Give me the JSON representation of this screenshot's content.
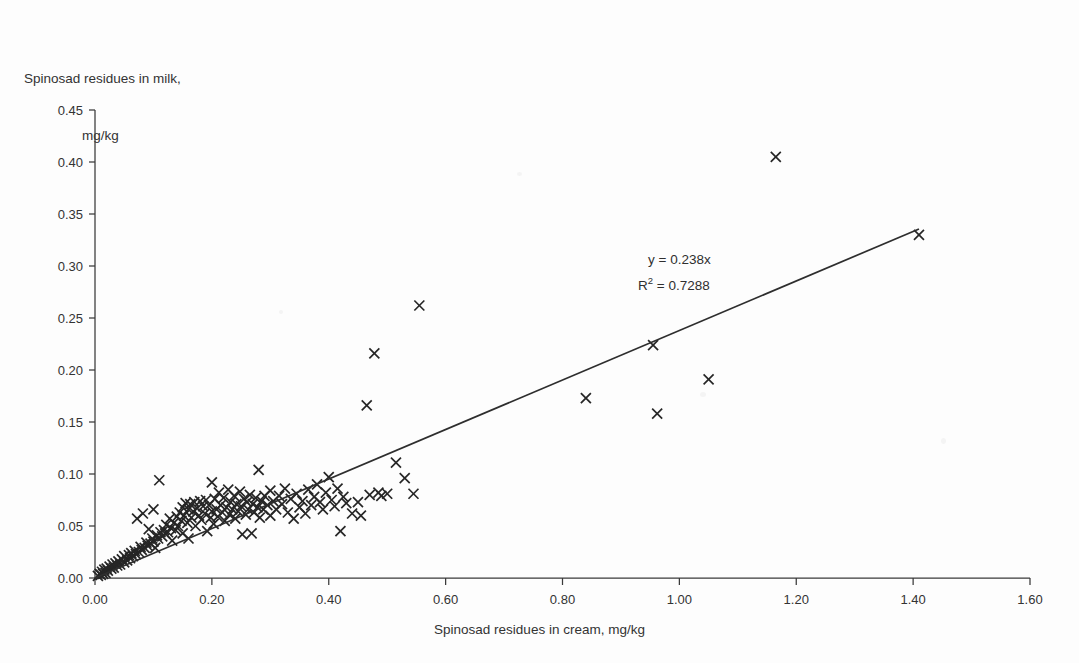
{
  "axes": {
    "y_title_line1": "Spinosad residues in milk,",
    "y_title_line2": "mg/kg",
    "x_title": "Spinosad residues in cream, mg/kg"
  },
  "annotation": {
    "equation": "y = 0.238x",
    "r_squared_prefix": "R",
    "r_squared_sup": "2",
    "r_squared_value": " = 0.7288"
  },
  "colors": {
    "background": "#fdfdfd",
    "axis": "#3a3a3a",
    "marker": "#262626",
    "trendline": "#2e2e2e",
    "text": "#333333"
  },
  "chart_data": {
    "type": "scatter",
    "title": "",
    "xlabel": "Spinosad residues in cream, mg/kg",
    "ylabel": "Spinosad residues in milk, mg/kg",
    "xlim": [
      0.0,
      1.6
    ],
    "ylim": [
      0.0,
      0.45
    ],
    "xticks": [
      "0.00",
      "0.20",
      "0.40",
      "0.60",
      "0.80",
      "1.00",
      "1.20",
      "1.40",
      "1.60"
    ],
    "xtick_values": [
      0.0,
      0.2,
      0.4,
      0.6,
      0.8,
      1.0,
      1.2,
      1.4,
      1.6
    ],
    "yticks": [
      "0.00",
      "0.05",
      "0.10",
      "0.15",
      "0.20",
      "0.25",
      "0.30",
      "0.35",
      "0.40",
      "0.45"
    ],
    "ytick_values": [
      0.0,
      0.05,
      0.1,
      0.15,
      0.2,
      0.25,
      0.3,
      0.35,
      0.4,
      0.45
    ],
    "grid": false,
    "legend": null,
    "marker_style": "x",
    "annotations": [
      "y = 0.238x",
      "R² = 0.7288"
    ],
    "fit": {
      "type": "linear-through-origin",
      "slope": 0.238,
      "intercept": 0.0,
      "r_squared": 0.7288,
      "x_start": 0.0,
      "x_end": 1.41
    },
    "series": [
      {
        "name": "Spinosad residue pairs",
        "points": [
          [
            0.005,
            0.002
          ],
          [
            0.008,
            0.004
          ],
          [
            0.01,
            0.003
          ],
          [
            0.012,
            0.006
          ],
          [
            0.014,
            0.004
          ],
          [
            0.016,
            0.008
          ],
          [
            0.018,
            0.005
          ],
          [
            0.02,
            0.009
          ],
          [
            0.022,
            0.007
          ],
          [
            0.025,
            0.011
          ],
          [
            0.028,
            0.009
          ],
          [
            0.03,
            0.013
          ],
          [
            0.032,
            0.01
          ],
          [
            0.035,
            0.014
          ],
          [
            0.038,
            0.012
          ],
          [
            0.04,
            0.016
          ],
          [
            0.043,
            0.013
          ],
          [
            0.046,
            0.018
          ],
          [
            0.05,
            0.015
          ],
          [
            0.05,
            0.021
          ],
          [
            0.055,
            0.017
          ],
          [
            0.058,
            0.022
          ],
          [
            0.06,
            0.019
          ],
          [
            0.062,
            0.024
          ],
          [
            0.065,
            0.021
          ],
          [
            0.068,
            0.026
          ],
          [
            0.07,
            0.023
          ],
          [
            0.072,
            0.057
          ],
          [
            0.075,
            0.025
          ],
          [
            0.078,
            0.03
          ],
          [
            0.08,
            0.027
          ],
          [
            0.082,
            0.062
          ],
          [
            0.085,
            0.029
          ],
          [
            0.088,
            0.034
          ],
          [
            0.09,
            0.031
          ],
          [
            0.092,
            0.047
          ],
          [
            0.095,
            0.033
          ],
          [
            0.098,
            0.038
          ],
          [
            0.1,
            0.035
          ],
          [
            0.1,
            0.066
          ],
          [
            0.103,
            0.029
          ],
          [
            0.106,
            0.041
          ],
          [
            0.108,
            0.038
          ],
          [
            0.11,
            0.094
          ],
          [
            0.112,
            0.044
          ],
          [
            0.115,
            0.04
          ],
          [
            0.118,
            0.046
          ],
          [
            0.12,
            0.043
          ],
          [
            0.122,
            0.051
          ],
          [
            0.125,
            0.044
          ],
          [
            0.128,
            0.057
          ],
          [
            0.13,
            0.048
          ],
          [
            0.132,
            0.036
          ],
          [
            0.135,
            0.053
          ],
          [
            0.138,
            0.046
          ],
          [
            0.14,
            0.059
          ],
          [
            0.142,
            0.05
          ],
          [
            0.145,
            0.063
          ],
          [
            0.148,
            0.055
          ],
          [
            0.15,
            0.068
          ],
          [
            0.15,
            0.043
          ],
          [
            0.152,
            0.06
          ],
          [
            0.155,
            0.072
          ],
          [
            0.158,
            0.053
          ],
          [
            0.16,
            0.066
          ],
          [
            0.16,
            0.038
          ],
          [
            0.163,
            0.071
          ],
          [
            0.165,
            0.058
          ],
          [
            0.168,
            0.064
          ],
          [
            0.17,
            0.073
          ],
          [
            0.172,
            0.05
          ],
          [
            0.175,
            0.067
          ],
          [
            0.178,
            0.06
          ],
          [
            0.18,
            0.074
          ],
          [
            0.182,
            0.056
          ],
          [
            0.185,
            0.069
          ],
          [
            0.188,
            0.062
          ],
          [
            0.19,
            0.075
          ],
          [
            0.192,
            0.045
          ],
          [
            0.195,
            0.07
          ],
          [
            0.198,
            0.058
          ],
          [
            0.2,
            0.064
          ],
          [
            0.2,
            0.092
          ],
          [
            0.203,
            0.052
          ],
          [
            0.205,
            0.076
          ],
          [
            0.208,
            0.066
          ],
          [
            0.21,
            0.059
          ],
          [
            0.212,
            0.082
          ],
          [
            0.215,
            0.07
          ],
          [
            0.218,
            0.063
          ],
          [
            0.22,
            0.077
          ],
          [
            0.222,
            0.055
          ],
          [
            0.225,
            0.068
          ],
          [
            0.228,
            0.085
          ],
          [
            0.23,
            0.061
          ],
          [
            0.232,
            0.073
          ],
          [
            0.235,
            0.066
          ],
          [
            0.238,
            0.079
          ],
          [
            0.24,
            0.057
          ],
          [
            0.242,
            0.071
          ],
          [
            0.245,
            0.064
          ],
          [
            0.248,
            0.083
          ],
          [
            0.25,
            0.069
          ],
          [
            0.252,
            0.042
          ],
          [
            0.255,
            0.076
          ],
          [
            0.258,
            0.061
          ],
          [
            0.26,
            0.073
          ],
          [
            0.262,
            0.066
          ],
          [
            0.265,
            0.08
          ],
          [
            0.268,
            0.043
          ],
          [
            0.27,
            0.071
          ],
          [
            0.272,
            0.063
          ],
          [
            0.275,
            0.077
          ],
          [
            0.278,
            0.068
          ],
          [
            0.28,
            0.104
          ],
          [
            0.282,
            0.058
          ],
          [
            0.285,
            0.074
          ],
          [
            0.288,
            0.066
          ],
          [
            0.29,
            0.079
          ],
          [
            0.295,
            0.07
          ],
          [
            0.3,
            0.084
          ],
          [
            0.3,
            0.06
          ],
          [
            0.305,
            0.074
          ],
          [
            0.31,
            0.066
          ],
          [
            0.315,
            0.079
          ],
          [
            0.32,
            0.071
          ],
          [
            0.325,
            0.086
          ],
          [
            0.33,
            0.063
          ],
          [
            0.335,
            0.076
          ],
          [
            0.34,
            0.057
          ],
          [
            0.345,
            0.081
          ],
          [
            0.35,
            0.068
          ],
          [
            0.355,
            0.074
          ],
          [
            0.36,
            0.062
          ],
          [
            0.365,
            0.085
          ],
          [
            0.37,
            0.07
          ],
          [
            0.375,
            0.078
          ],
          [
            0.38,
            0.09
          ],
          [
            0.385,
            0.073
          ],
          [
            0.39,
            0.066
          ],
          [
            0.395,
            0.082
          ],
          [
            0.4,
            0.097
          ],
          [
            0.405,
            0.075
          ],
          [
            0.41,
            0.069
          ],
          [
            0.415,
            0.086
          ],
          [
            0.42,
            0.045
          ],
          [
            0.425,
            0.078
          ],
          [
            0.43,
            0.072
          ],
          [
            0.44,
            0.062
          ],
          [
            0.45,
            0.073
          ],
          [
            0.455,
            0.06
          ],
          [
            0.465,
            0.166
          ],
          [
            0.47,
            0.08
          ],
          [
            0.478,
            0.216
          ],
          [
            0.485,
            0.082
          ],
          [
            0.49,
            0.079
          ],
          [
            0.5,
            0.081
          ],
          [
            0.515,
            0.111
          ],
          [
            0.53,
            0.096
          ],
          [
            0.545,
            0.081
          ],
          [
            0.555,
            0.262
          ],
          [
            0.84,
            0.173
          ],
          [
            0.955,
            0.224
          ],
          [
            0.962,
            0.158
          ],
          [
            1.05,
            0.191
          ],
          [
            1.165,
            0.405
          ],
          [
            1.41,
            0.33
          ]
        ]
      }
    ]
  }
}
